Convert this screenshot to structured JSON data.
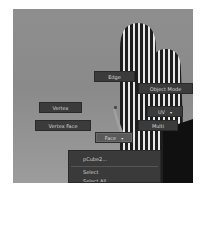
{
  "viewport": {
    "background_subject": "saguaro cactus photo (grayscale)",
    "colors": {
      "sky": "#8c8c8c",
      "button_bg": "#3b3b3b",
      "button_text": "#d8d8d8",
      "highlight_bg": "#5a5a5a",
      "menu_bg": "#3a3a3a"
    }
  },
  "marking_menu": {
    "north": {
      "label": "Edge"
    },
    "northeast": {
      "label": "Object Mode"
    },
    "west": {
      "label": "Vertex"
    },
    "east": {
      "label": "UV",
      "icon": "dropdown-arrow-icon",
      "arrow": "▾"
    },
    "southwest": {
      "label": "Vertex Face"
    },
    "southeast": {
      "label": "Multi"
    },
    "south": {
      "label": "Face",
      "icon": "dropdown-arrow-icon",
      "arrow": "▾",
      "highlighted": true
    }
  },
  "submenu": {
    "items": [
      {
        "label": "pCube2..."
      },
      {
        "label": "Select"
      },
      {
        "label": "Select All"
      }
    ]
  }
}
